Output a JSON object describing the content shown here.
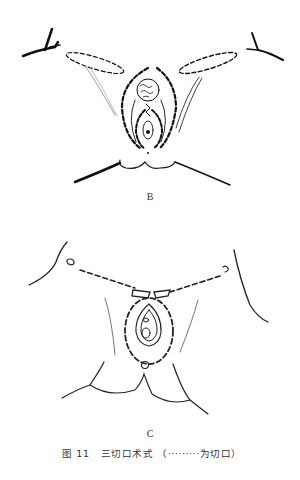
{
  "figure": {
    "panels": [
      {
        "label": "B"
      },
      {
        "label": "C"
      }
    ],
    "caption": {
      "number": "图 11",
      "title": "三切口术式",
      "note": "（·········为切口）"
    }
  }
}
